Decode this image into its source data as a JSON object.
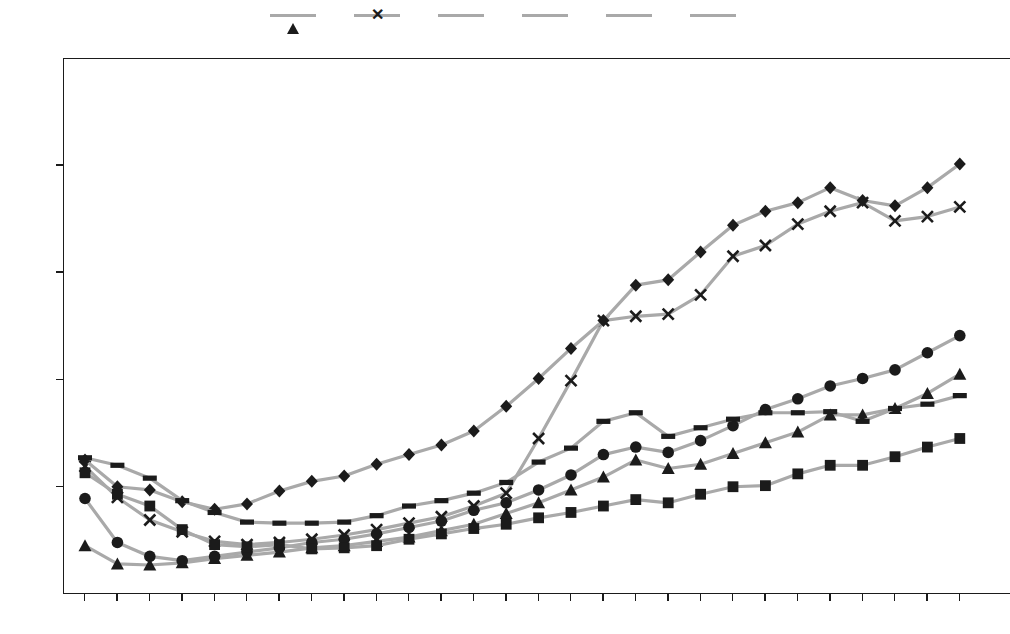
{
  "legend": {
    "position": "top-center",
    "items": [
      {
        "label": "Armenia",
        "marker": "triangle-marker-icon",
        "color": "#1b1b1b"
      },
      {
        "label": "Azerbaijan",
        "marker": "x-marker-icon",
        "color": "#1b1b1b"
      },
      {
        "label": "Belarus",
        "marker": "diamond-marker-icon",
        "color": "#1b1b1b"
      },
      {
        "label": "Georgia",
        "marker": "circle-marker-icon",
        "color": "#1b1b1b"
      },
      {
        "label": "Moldova",
        "marker": "square-marker-icon",
        "color": "#1b1b1b"
      },
      {
        "label": "Ukraine",
        "marker": "dash-marker-icon",
        "color": "#1b1b1b"
      }
    ]
  },
  "axes": {
    "y_ticks": [
      "25000",
      "20000",
      "15000",
      "10000",
      "5000",
      "0"
    ],
    "x_ticks": [
      "1991",
      "1992",
      "1993",
      "1994",
      "1995",
      "1996",
      "1997",
      "1998",
      "1999",
      "2000",
      "2001",
      "2002",
      "2003",
      "2004",
      "2005",
      "2006",
      "2007",
      "2008",
      "2009",
      "2010",
      "2011",
      "2012",
      "2013",
      "2014",
      "2015",
      "2016",
      "2017",
      "2018"
    ]
  },
  "chart_data": {
    "type": "line",
    "title": "",
    "subtitle": "",
    "xlabel": "",
    "ylabel": "",
    "xlim": [
      1991,
      2018
    ],
    "ylim": [
      0,
      25000
    ],
    "ytick_step": 5000,
    "grid": false,
    "legend_position": "top-center",
    "line_color": "#a9a9a9",
    "marker_color": "#1b1b1b",
    "categories": [
      1991,
      1992,
      1993,
      1994,
      1995,
      1996,
      1997,
      1998,
      1999,
      2000,
      2001,
      2002,
      2003,
      2004,
      2005,
      2006,
      2007,
      2008,
      2009,
      2010,
      2011,
      2012,
      2013,
      2014,
      2015,
      2016,
      2017,
      2018
    ],
    "series": [
      {
        "name": "Armenia",
        "marker": "triangle",
        "values": [
          2300,
          1450,
          1400,
          1500,
          1700,
          1850,
          2000,
          2200,
          2300,
          2500,
          2700,
          3000,
          3300,
          3800,
          4300,
          4900,
          5500,
          6300,
          5900,
          6100,
          6600,
          7100,
          7600,
          8400,
          8400,
          8700,
          9400,
          10300
        ]
      },
      {
        "name": "Azerbaijan",
        "marker": "x",
        "values": [
          6000,
          4550,
          3500,
          2950,
          2500,
          2350,
          2450,
          2600,
          2800,
          3050,
          3350,
          3650,
          4150,
          4750,
          7300,
          10000,
          12800,
          13000,
          13100,
          14000,
          15800,
          16300,
          17300,
          17900,
          18300,
          17450,
          17650,
          18100
        ]
      },
      {
        "name": "Belarus",
        "marker": "diamond",
        "values": [
          6300,
          5050,
          4900,
          4350,
          4000,
          4250,
          4850,
          5300,
          5550,
          6100,
          6550,
          7000,
          7650,
          8800,
          10100,
          11500,
          12800,
          14450,
          14700,
          16000,
          17250,
          17900,
          18300,
          19000,
          18400,
          18150,
          19000,
          20100
        ]
      },
      {
        "name": "Georgia",
        "marker": "circle",
        "values": [
          4500,
          2450,
          1800,
          1600,
          1800,
          2000,
          2200,
          2450,
          2600,
          2850,
          3150,
          3450,
          3950,
          4300,
          4900,
          5600,
          6550,
          6900,
          6650,
          7200,
          7900,
          8650,
          9150,
          9750,
          10100,
          10500,
          11300,
          12100
        ]
      },
      {
        "name": "Moldova",
        "marker": "square",
        "values": [
          5700,
          4700,
          4150,
          3050,
          2350,
          2250,
          2350,
          2150,
          2200,
          2300,
          2600,
          2850,
          3100,
          3300,
          3600,
          3850,
          4150,
          4450,
          4300,
          4700,
          5050,
          5100,
          5650,
          6050,
          6050,
          6450,
          6900,
          7300
        ]
      },
      {
        "name": "Ukraine",
        "marker": "dash",
        "values": [
          6400,
          6050,
          5450,
          4400,
          3850,
          3400,
          3350,
          3350,
          3400,
          3700,
          4150,
          4400,
          4750,
          5250,
          6200,
          6850,
          8100,
          8500,
          7400,
          7800,
          8200,
          8500,
          8500,
          8550,
          8100,
          8700,
          8900,
          9300
        ]
      }
    ]
  }
}
